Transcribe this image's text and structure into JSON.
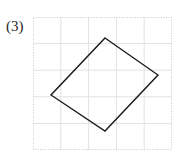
{
  "figure": {
    "label": "(3)",
    "background_color": "#ffffff"
  },
  "grid": {
    "border_color": "#c9c9c9",
    "line_color": "#e2e2e2",
    "border_style": "dotted",
    "x": 33,
    "y": 17,
    "width": 139,
    "height": 133,
    "columns": 5,
    "rows": 5,
    "cell_width": 27.8,
    "cell_height": 26.6
  },
  "chart_data": {
    "type": "scatter",
    "title": "(3)",
    "xlabel": "",
    "ylabel": "",
    "grid": true,
    "legend": "none",
    "xlim": [
      0,
      5
    ],
    "ylim": [
      0,
      5
    ],
    "shapes": [
      {
        "name": "quadrilateral",
        "kind": "polygon",
        "closed": true,
        "stroke_color": "#1c1c1c",
        "stroke_width": 1.4,
        "fill": "none",
        "vertices_px": [
          [
            105,
            38
          ],
          [
            158,
            75
          ],
          [
            105,
            131
          ],
          [
            51,
            95
          ]
        ],
        "vertices_grid": [
          [
            2.59,
            4.22
          ],
          [
            4.5,
            3.04
          ],
          [
            2.59,
            0.71
          ],
          [
            0.65,
            2.18
          ]
        ]
      }
    ]
  }
}
